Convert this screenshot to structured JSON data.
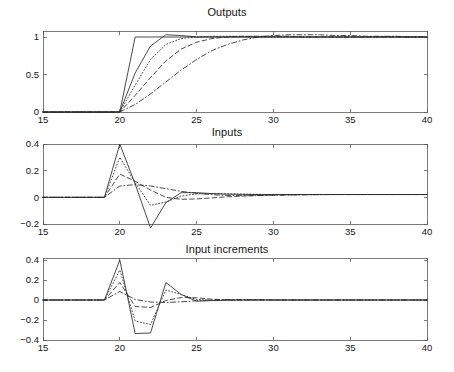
{
  "figure": {
    "width": 454,
    "height": 372,
    "background": "#ffffff",
    "line_color": "#2b2b2b",
    "axis_color": "#595959"
  },
  "panels": [
    {
      "id": "outputs",
      "title": "Outputs",
      "xlabel": "",
      "ylabel": "",
      "xticks": [
        "15",
        "20",
        "25",
        "30",
        "35",
        "40"
      ],
      "yticks": [
        "0",
        "0.5",
        "1"
      ]
    },
    {
      "id": "inputs",
      "title": "Inputs",
      "xlabel": "",
      "ylabel": "",
      "xticks": [
        "15",
        "20",
        "25",
        "30",
        "35",
        "40"
      ],
      "yticks": [
        "-0.2",
        "0",
        "0.2",
        "0.4"
      ]
    },
    {
      "id": "input-increments",
      "title": "Input increments",
      "xlabel": "",
      "ylabel": "",
      "xticks": [
        "15",
        "20",
        "25",
        "30",
        "35",
        "40"
      ],
      "yticks": [
        "-0.4",
        "-0.2",
        "0",
        "0.2",
        "0.4"
      ]
    }
  ],
  "chart_data": [
    {
      "type": "line",
      "title": "Outputs",
      "xlabel": "",
      "ylabel": "",
      "xlim": [
        15,
        40
      ],
      "ylim": [
        0,
        1.08
      ],
      "xticks": [
        15,
        20,
        25,
        30,
        35,
        40
      ],
      "yticks": [
        0,
        0.5,
        1
      ],
      "grid": false,
      "legend": "none",
      "x": [
        15,
        16,
        17,
        18,
        19,
        20,
        21,
        22,
        23,
        24,
        25,
        26,
        27,
        28,
        29,
        30,
        31,
        32,
        33,
        34,
        35,
        36,
        37,
        38,
        39,
        40
      ],
      "series": [
        {
          "name": "output-fastest",
          "style": "solid",
          "values": [
            0,
            0,
            0,
            0,
            0,
            0,
            1.0,
            1.0,
            1.0,
            1.0,
            1.0,
            1.0,
            1.0,
            1.0,
            1.0,
            1.0,
            1.0,
            1.0,
            1.0,
            1.0,
            1.0,
            1.0,
            1.0,
            1.0,
            1.0,
            1.0
          ]
        },
        {
          "name": "output-fast",
          "style": "solid",
          "values": [
            0,
            0,
            0,
            0,
            0,
            0,
            0.52,
            0.88,
            1.03,
            1.02,
            1.0,
            1.0,
            1.0,
            1.0,
            1.0,
            1.0,
            1.0,
            1.0,
            1.0,
            1.0,
            1.0,
            1.0,
            1.0,
            1.0,
            1.0,
            1.0
          ]
        },
        {
          "name": "output-medium",
          "style": "dotted",
          "values": [
            0,
            0,
            0,
            0,
            0,
            0,
            0.36,
            0.7,
            0.9,
            0.98,
            1.0,
            1.01,
            1.01,
            1.01,
            1.0,
            1.0,
            1.0,
            1.0,
            1.0,
            1.0,
            1.0,
            1.0,
            1.0,
            1.0,
            1.0,
            1.0
          ]
        },
        {
          "name": "output-slow",
          "style": "dashed",
          "values": [
            0,
            0,
            0,
            0,
            0,
            0,
            0.22,
            0.46,
            0.68,
            0.84,
            0.93,
            0.98,
            1.0,
            1.01,
            1.01,
            1.01,
            1.01,
            1.0,
            1.0,
            1.0,
            1.0,
            1.0,
            1.0,
            1.0,
            1.0,
            1.0
          ]
        },
        {
          "name": "output-slowest",
          "style": "dashdot",
          "values": [
            0,
            0,
            0,
            0,
            0,
            0,
            0.1,
            0.24,
            0.4,
            0.56,
            0.7,
            0.82,
            0.9,
            0.96,
            1.0,
            1.02,
            1.03,
            1.03,
            1.03,
            1.02,
            1.02,
            1.01,
            1.01,
            1.01,
            1.0,
            1.0
          ]
        }
      ]
    },
    {
      "type": "line",
      "title": "Inputs",
      "xlabel": "",
      "ylabel": "",
      "xlim": [
        15,
        40
      ],
      "ylim": [
        -0.2,
        0.4
      ],
      "xticks": [
        15,
        20,
        25,
        30,
        35,
        40
      ],
      "yticks": [
        -0.2,
        0,
        0.2,
        0.4
      ],
      "grid": false,
      "legend": "none",
      "x": [
        15,
        16,
        17,
        18,
        19,
        20,
        21,
        22,
        23,
        24,
        25,
        26,
        27,
        28,
        29,
        30,
        31,
        32,
        33,
        34,
        35,
        36,
        37,
        38,
        39,
        40
      ],
      "series": [
        {
          "name": "input-fastest",
          "style": "solid",
          "values": [
            0,
            0,
            0,
            0,
            0,
            0.4,
            0.1,
            -0.23,
            -0.04,
            0.035,
            0.035,
            0.028,
            0.024,
            0.022,
            0.021,
            0.021,
            0.021,
            0.021,
            0.021,
            0.021,
            0.021,
            0.021,
            0.021,
            0.021,
            0.021,
            0.021
          ]
        },
        {
          "name": "input-fast",
          "style": "dotted",
          "values": [
            0,
            0,
            0,
            0,
            0,
            0.3,
            0.11,
            -0.06,
            -0.035,
            0.01,
            0.026,
            0.028,
            0.026,
            0.024,
            0.022,
            0.021,
            0.021,
            0.021,
            0.021,
            0.021,
            0.021,
            0.021,
            0.021,
            0.021,
            0.021,
            0.021
          ]
        },
        {
          "name": "input-medium",
          "style": "dashed",
          "values": [
            0,
            0,
            0,
            0,
            0,
            0.175,
            0.12,
            0.055,
            0.0,
            -0.015,
            -0.012,
            -0.004,
            0.004,
            0.01,
            0.014,
            0.017,
            0.019,
            0.02,
            0.021,
            0.021,
            0.021,
            0.021,
            0.021,
            0.021,
            0.021,
            0.021
          ]
        },
        {
          "name": "input-slow",
          "style": "dashdot",
          "values": [
            0,
            0,
            0,
            0,
            0,
            0.085,
            0.095,
            0.085,
            0.065,
            0.045,
            0.03,
            0.02,
            0.014,
            0.012,
            0.013,
            0.015,
            0.017,
            0.019,
            0.02,
            0.021,
            0.021,
            0.021,
            0.021,
            0.021,
            0.021,
            0.021
          ]
        }
      ]
    },
    {
      "type": "line",
      "title": "Input increments",
      "xlabel": "",
      "ylabel": "",
      "xlim": [
        15,
        40
      ],
      "ylim": [
        -0.4,
        0.42
      ],
      "xticks": [
        15,
        20,
        25,
        30,
        35,
        40
      ],
      "yticks": [
        -0.4,
        -0.2,
        0,
        0.2,
        0.4
      ],
      "grid": false,
      "legend": "none",
      "x": [
        15,
        16,
        17,
        18,
        19,
        20,
        21,
        22,
        23,
        24,
        25,
        26,
        27,
        28,
        29,
        30,
        31,
        32,
        33,
        34,
        35,
        36,
        37,
        38,
        39,
        40
      ],
      "series": [
        {
          "name": "increment-fastest",
          "style": "solid",
          "values": [
            0,
            0,
            0,
            0,
            0,
            0.4,
            -0.335,
            -0.33,
            0.175,
            0.055,
            -0.012,
            -0.006,
            -0.002,
            0,
            0,
            0,
            0,
            0,
            0,
            0,
            0,
            0,
            0,
            0,
            0,
            0
          ]
        },
        {
          "name": "increment-fast",
          "style": "dotted",
          "values": [
            0,
            0,
            0,
            0,
            0,
            0.3,
            -0.21,
            -0.245,
            0.1,
            0.055,
            0.005,
            -0.004,
            -0.002,
            0,
            0,
            0,
            0,
            0,
            0,
            0,
            0,
            0,
            0,
            0,
            0,
            0
          ]
        },
        {
          "name": "increment-medium",
          "style": "dashed",
          "values": [
            0,
            0,
            0,
            0,
            0,
            0.175,
            -0.065,
            -0.075,
            -0.005,
            0.025,
            0.022,
            0.008,
            0.001,
            -0.001,
            0,
            0,
            0,
            0,
            0,
            0,
            0,
            0,
            0,
            0,
            0,
            0
          ]
        },
        {
          "name": "increment-slow",
          "style": "dashdot",
          "values": [
            0,
            0,
            0,
            0,
            0,
            0.085,
            0.005,
            -0.02,
            -0.025,
            -0.018,
            -0.008,
            0.0,
            0.004,
            0.004,
            0.003,
            0.001,
            0,
            0,
            0,
            0,
            0,
            0,
            0,
            0,
            0,
            0
          ]
        }
      ]
    }
  ]
}
